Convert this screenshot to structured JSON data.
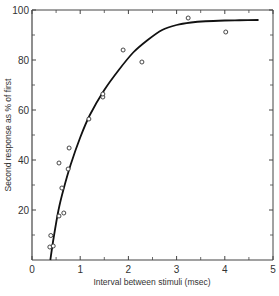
{
  "chart_data": {
    "type": "scatter",
    "title": "",
    "xlabel": "Interval between stimuli (msec)",
    "ylabel": "Second response as % of first",
    "xlim": [
      0,
      5
    ],
    "ylim": [
      0,
      100
    ],
    "x_ticks": [
      0,
      1,
      2,
      3,
      4,
      5
    ],
    "x_tick_labels": [
      "0",
      "1",
      "2",
      "3",
      "4",
      "5"
    ],
    "x_minor_ticks": [
      0.5,
      1.5,
      2.5,
      3.5,
      4.5
    ],
    "y_ticks": [
      20,
      40,
      60,
      80,
      100
    ],
    "y_tick_labels": [
      "20",
      "40",
      "60",
      "80",
      "100"
    ],
    "y_minor_ticks": [
      10,
      30,
      50,
      70,
      90
    ],
    "grid": false,
    "legend": "none",
    "series": [
      {
        "name": "observed",
        "kind": "points",
        "marker": "open-circle",
        "points": [
          {
            "x": 0.37,
            "y": 5.2
          },
          {
            "x": 0.44,
            "y": 5.6
          },
          {
            "x": 0.39,
            "y": 9.8
          },
          {
            "x": 0.56,
            "y": 17.6
          },
          {
            "x": 0.66,
            "y": 18.8
          },
          {
            "x": 0.62,
            "y": 28.8
          },
          {
            "x": 0.75,
            "y": 36.4
          },
          {
            "x": 0.56,
            "y": 38.8
          },
          {
            "x": 0.77,
            "y": 44.8
          },
          {
            "x": 1.18,
            "y": 56.4
          },
          {
            "x": 1.47,
            "y": 65.2
          },
          {
            "x": 1.47,
            "y": 66.4
          },
          {
            "x": 2.28,
            "y": 79.2
          },
          {
            "x": 1.89,
            "y": 84.0
          },
          {
            "x": 3.24,
            "y": 96.8
          },
          {
            "x": 4.02,
            "y": 91.2
          }
        ]
      },
      {
        "name": "fitted curve",
        "kind": "line",
        "x": [
          0.38,
          0.45,
          0.55,
          0.65,
          0.8,
          1.0,
          1.2,
          1.5,
          1.8,
          2.1,
          2.4,
          2.7,
          3.0,
          3.3,
          3.6,
          4.0,
          4.3,
          4.7
        ],
        "y": [
          0,
          9,
          20,
          28,
          38,
          49,
          58,
          68,
          76,
          83,
          88,
          92,
          94,
          95,
          95.5,
          95.8,
          95.9,
          96
        ]
      }
    ]
  }
}
